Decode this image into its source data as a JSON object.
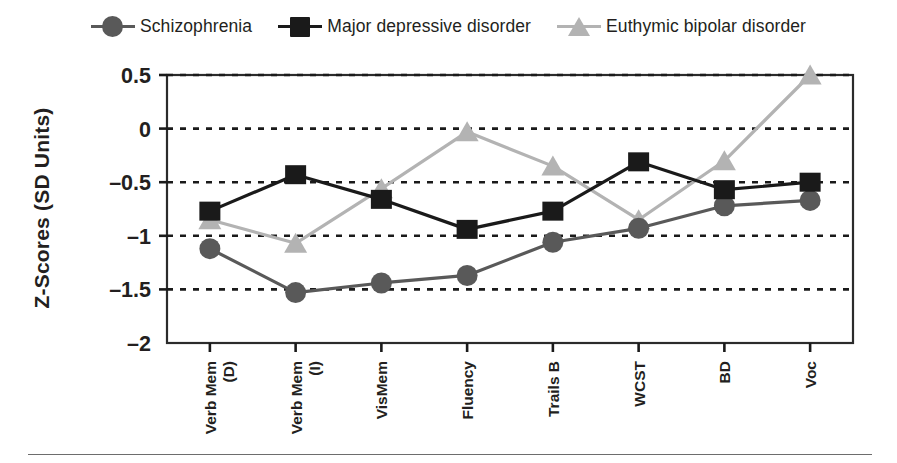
{
  "chart_data": {
    "type": "line",
    "title": "",
    "xlabel": "",
    "ylabel": "Z-Scores (SD Units)",
    "categories": [
      "Verb Mem (D)",
      "Verb Mem (I)",
      "VisMem",
      "Fluency",
      "Trails B",
      "WCST",
      "BD",
      "Voc"
    ],
    "category_lines": [
      [
        "Verb Mem",
        "(D)"
      ],
      [
        "Verb Mem",
        "(I)"
      ],
      [
        "VisMem",
        ""
      ],
      [
        "Fluency",
        ""
      ],
      [
        "Trails B",
        ""
      ],
      [
        "WCST",
        ""
      ],
      [
        "BD",
        ""
      ],
      [
        "Voc",
        ""
      ]
    ],
    "ylim": [
      -2,
      0.5
    ],
    "yticks": [
      0.5,
      0,
      -0.5,
      -1,
      -1.5,
      -2
    ],
    "ytick_labels": [
      "0.5",
      "0",
      "–0.5",
      "–1",
      "–1.5",
      "–2"
    ],
    "grid": true,
    "grid_style": "dotted-horizontal",
    "legend_position": "top-center",
    "series": [
      {
        "name": "Schizophrenia",
        "marker": "circle",
        "color": "#595959",
        "values": [
          -1.12,
          -1.53,
          -1.44,
          -1.37,
          -1.06,
          -0.93,
          -0.72,
          -0.67
        ]
      },
      {
        "name": "Major depressive disorder",
        "marker": "square",
        "color": "#1a1a1a",
        "values": [
          -0.77,
          -0.43,
          -0.66,
          -0.94,
          -0.77,
          -0.31,
          -0.57,
          -0.5
        ]
      },
      {
        "name": "Euthymic bipolar disorder",
        "marker": "triangle",
        "color": "#b3b3b3",
        "values": [
          -0.85,
          -1.07,
          -0.56,
          -0.03,
          -0.35,
          -0.85,
          -0.3,
          0.5
        ]
      }
    ]
  },
  "legend": {
    "items": [
      {
        "label": "Schizophrenia",
        "marker": "circle",
        "color": "#595959"
      },
      {
        "label": "Major depressive disorder",
        "marker": "square",
        "color": "#1a1a1a"
      },
      {
        "label": "Euthymic bipolar disorder",
        "marker": "triangle",
        "color": "#b3b3b3"
      }
    ]
  },
  "axis": {
    "y_title": "Z-Scores (SD Units)"
  },
  "colors": {
    "text": "#231f20",
    "plot_border": "#2b2b2b",
    "grid": "#1a1a1a",
    "rule": "#6d6d6d"
  }
}
